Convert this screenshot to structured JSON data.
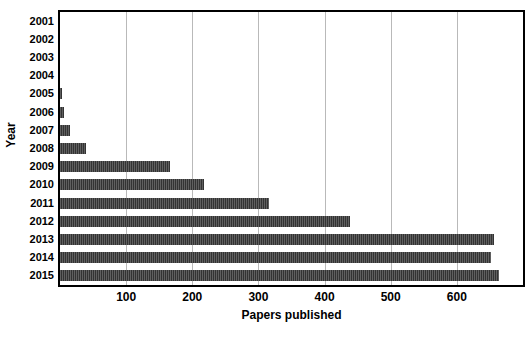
{
  "chart_data": {
    "type": "bar",
    "orientation": "horizontal",
    "title": "",
    "xlabel": "Papers published",
    "ylabel": "Year",
    "categories": [
      "2001",
      "2002",
      "2003",
      "2004",
      "2005",
      "2006",
      "2007",
      "2008",
      "2009",
      "2010",
      "2011",
      "2012",
      "2013",
      "2014",
      "2015"
    ],
    "values": [
      0,
      0,
      0,
      0,
      3,
      6,
      15,
      40,
      167,
      218,
      316,
      439,
      656,
      652,
      664
    ],
    "xlim": [
      0,
      700
    ],
    "xticks": [
      100,
      200,
      300,
      400,
      500,
      600
    ],
    "xticklabels": [
      "100",
      "200",
      "300",
      "400",
      "500",
      "600"
    ],
    "grid": "vertical",
    "legend": "none",
    "bar_color": "#333333",
    "frame_color": "#000000",
    "gridline_color": "#b9b9b9"
  },
  "axes": {
    "y_title": "Year",
    "x_title": "Papers published"
  }
}
